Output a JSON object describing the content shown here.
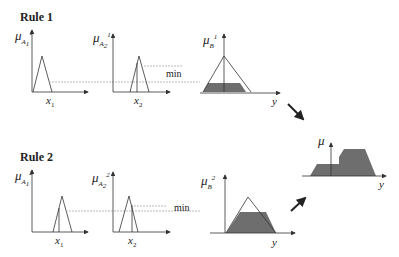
{
  "rules": [
    {
      "label": "Rule 1"
    },
    {
      "label": "Rule 2"
    }
  ],
  "labels": {
    "mu": "μ",
    "x1": "x",
    "x1_sub": "1",
    "x2": "x",
    "x2_sub": "2",
    "y": "y",
    "min": "min",
    "A1": "A",
    "A2": "A",
    "B": "B",
    "sub1": "1",
    "sub2": "2",
    "sup1": "1",
    "sup2": "2"
  },
  "colors": {
    "line": "#333333",
    "fill": "#6e6e6e",
    "dotted": "#aaaaaa"
  }
}
